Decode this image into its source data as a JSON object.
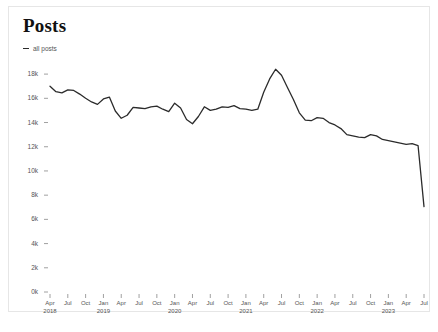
{
  "card": {
    "title": "Posts"
  },
  "legend": {
    "marker": "line-swatch-icon",
    "label": "all posts"
  },
  "chart_data": {
    "type": "line",
    "title": "Posts",
    "xlabel": "",
    "ylabel": "",
    "ylim": [
      0,
      19000
    ],
    "grid": false,
    "legend_position": "top-left",
    "line_color": "#2b2b2b",
    "ytick_labels": [
      "0k",
      "2k",
      "4k",
      "6k",
      "8k",
      "10k",
      "12k",
      "14k",
      "16k",
      "18k"
    ],
    "ytick_values": [
      0,
      2000,
      4000,
      6000,
      8000,
      10000,
      12000,
      14000,
      16000,
      18000
    ],
    "xtick_labels": [
      {
        "month": "Apr",
        "year": "2018"
      },
      {
        "month": "Jul",
        "year": ""
      },
      {
        "month": "Oct",
        "year": ""
      },
      {
        "month": "Jan",
        "year": "2019"
      },
      {
        "month": "Apr",
        "year": ""
      },
      {
        "month": "Jul",
        "year": ""
      },
      {
        "month": "Oct",
        "year": ""
      },
      {
        "month": "Jan",
        "year": "2020"
      },
      {
        "month": "Apr",
        "year": ""
      },
      {
        "month": "Jul",
        "year": ""
      },
      {
        "month": "Oct",
        "year": ""
      },
      {
        "month": "Jan",
        "year": "2021"
      },
      {
        "month": "Apr",
        "year": ""
      },
      {
        "month": "Jul",
        "year": ""
      },
      {
        "month": "Oct",
        "year": ""
      },
      {
        "month": "Jan",
        "year": "2022"
      },
      {
        "month": "Apr",
        "year": ""
      },
      {
        "month": "Jul",
        "year": ""
      },
      {
        "month": "Oct",
        "year": ""
      },
      {
        "month": "Jan",
        "year": "2023"
      },
      {
        "month": "Apr",
        "year": ""
      },
      {
        "month": "Jul",
        "year": ""
      }
    ],
    "series": [
      {
        "name": "all posts",
        "x": [
          "2018-04",
          "2018-05",
          "2018-06",
          "2018-07",
          "2018-08",
          "2018-09",
          "2018-10",
          "2018-11",
          "2018-12",
          "2019-01",
          "2019-02",
          "2019-03",
          "2019-04",
          "2019-05",
          "2019-06",
          "2019-07",
          "2019-08",
          "2019-09",
          "2019-10",
          "2019-11",
          "2019-12",
          "2020-01",
          "2020-02",
          "2020-03",
          "2020-04",
          "2020-05",
          "2020-06",
          "2020-07",
          "2020-08",
          "2020-09",
          "2020-10",
          "2020-11",
          "2020-12",
          "2021-01",
          "2021-02",
          "2021-03",
          "2021-04",
          "2021-05",
          "2021-06",
          "2021-07",
          "2021-08",
          "2021-09",
          "2021-10",
          "2021-11",
          "2021-12",
          "2022-01",
          "2022-02",
          "2022-03",
          "2022-04",
          "2022-05",
          "2022-06",
          "2022-07",
          "2022-08",
          "2022-09",
          "2022-10",
          "2022-11",
          "2022-12",
          "2023-01",
          "2023-02",
          "2023-03",
          "2023-04",
          "2023-05",
          "2023-06",
          "2023-07"
        ],
        "values": [
          17000,
          16550,
          16450,
          16700,
          16650,
          16350,
          16000,
          15700,
          15500,
          15950,
          16100,
          14950,
          14350,
          14600,
          15250,
          15200,
          15150,
          15300,
          15350,
          15100,
          14900,
          15600,
          15200,
          14250,
          13900,
          14500,
          15300,
          15000,
          15100,
          15300,
          15250,
          15400,
          15150,
          15100,
          15000,
          15100,
          16500,
          17600,
          18400,
          17900,
          16900,
          15900,
          14800,
          14200,
          14150,
          14400,
          14350,
          14000,
          13800,
          13500,
          13000,
          12900,
          12800,
          12750,
          13000,
          12900,
          12600,
          12500,
          12400,
          12300,
          12200,
          12250,
          12100,
          7050
        ]
      }
    ],
    "annotations": {
      "peak_label": "18.4k",
      "peak_x": "2020-06",
      "end_label": "7k",
      "end_x": "2023-07"
    }
  }
}
